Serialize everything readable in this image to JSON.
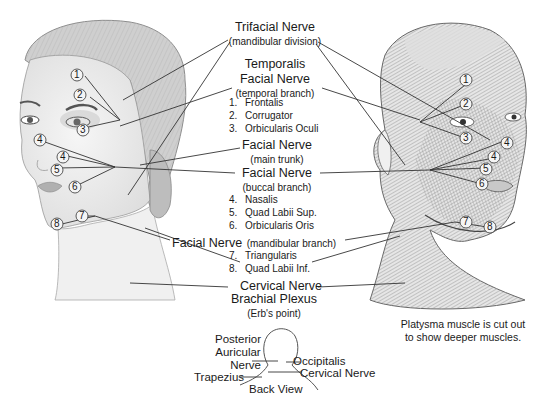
{
  "labels": {
    "trifacial": {
      "title": "Trifacial Nerve",
      "sub": "(mandibular division)"
    },
    "temporalis": {
      "title": "Temporalis"
    },
    "facial_temporal": {
      "title": "Facial Nerve",
      "sub": "(temporal branch)",
      "muscles": [
        {
          "n": "1.",
          "name": "Frontalis"
        },
        {
          "n": "2.",
          "name": "Corrugator"
        },
        {
          "n": "3.",
          "name": "Orbicularis Oculi"
        }
      ]
    },
    "facial_main": {
      "title": "Facial Nerve",
      "sub": "(main trunk)"
    },
    "facial_buccal": {
      "title": "Facial Nerve",
      "sub": "(buccal branch)",
      "muscles": [
        {
          "n": "4.",
          "name": "Nasalis"
        },
        {
          "n": "5.",
          "name": "Quad Labii Sup."
        },
        {
          "n": "6.",
          "name": "Orbicularis Oris"
        }
      ]
    },
    "facial_mandibular": {
      "title": "Facial Nerve",
      "sub": "(mandibular branch)",
      "muscles": [
        {
          "n": "7.",
          "name": "Triangularis"
        },
        {
          "n": "8.",
          "name": "Quad Labii Inf."
        }
      ]
    },
    "cervical": {
      "title": "Cervical Nerve"
    },
    "brachial": {
      "title": "Brachial Plexus",
      "sub": "(Erb's point)"
    }
  },
  "caption": {
    "line1": "Platysma muscle is cut out",
    "line2": "to show deeper muscles."
  },
  "back_view": {
    "posterior1": "Posterior",
    "posterior2": "Auricular",
    "posterior3": "Nerve",
    "occipitalis": "Occipitalis",
    "trapezius": "Trapezius",
    "cervical": "Cervical Nerve",
    "title": "Back View"
  },
  "markers_left": [
    "1",
    "2",
    "3",
    "4",
    "4",
    "5",
    "6",
    "7",
    "8"
  ],
  "markers_right": [
    "1",
    "2",
    "3",
    "4",
    "4",
    "5",
    "6",
    "7",
    "8"
  ]
}
